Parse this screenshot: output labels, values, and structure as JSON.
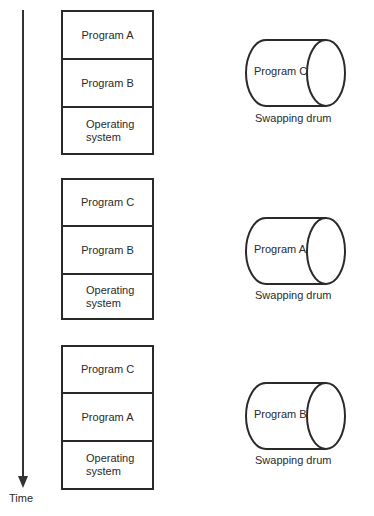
{
  "time_axis": {
    "label": "Time"
  },
  "snapshots": [
    {
      "memory": [
        {
          "label": "Program   A"
        },
        {
          "label": "Program   B"
        },
        {
          "label": "Operating\nsystem"
        }
      ],
      "drum": {
        "content": "Program C",
        "caption": "Swapping drum"
      }
    },
    {
      "memory": [
        {
          "label": "Program   C"
        },
        {
          "label": "Program B"
        },
        {
          "label": "Operating\nsystem"
        }
      ],
      "drum": {
        "content": "Program A",
        "caption": "Swapping drum"
      }
    },
    {
      "memory": [
        {
          "label": "Program C"
        },
        {
          "label": "Program A"
        },
        {
          "label": "Operating\nsystem"
        }
      ],
      "drum": {
        "content": "Program B",
        "caption": "Swapping drum"
      }
    }
  ]
}
